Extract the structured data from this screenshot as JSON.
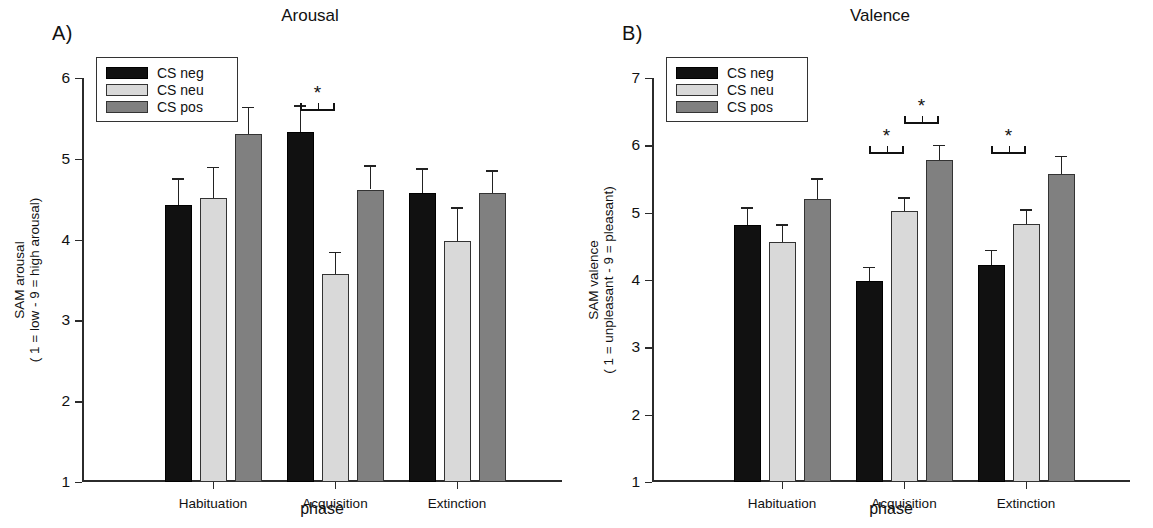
{
  "figure": {
    "panels": [
      {
        "letter": "A)",
        "title": "Arousal",
        "ylabel_line1": "SAM arousal",
        "ylabel_line2": "( 1 = low - 9 = high arousal)",
        "xlabel": "phase"
      },
      {
        "letter": "B)",
        "title": "Valence",
        "ylabel_line1": "SAM valence",
        "ylabel_line2": "( 1 = unpleasant - 9 = pleasant)",
        "xlabel": "phase"
      }
    ],
    "legend": {
      "items": [
        {
          "label": "CS neg",
          "color": "#111111",
          "key": "neg"
        },
        {
          "label": "CS neu",
          "color": "#d9d9d9",
          "key": "neu"
        },
        {
          "label": "CS pos",
          "color": "#808080",
          "key": "pos"
        }
      ]
    },
    "significance_marker": "*"
  },
  "chart_data": [
    {
      "type": "bar",
      "title": "Arousal",
      "panel": "A)",
      "xlabel": "phase",
      "ylabel": "SAM arousal ( 1 = low - 9 = high arousal)",
      "ylim": [
        1,
        6
      ],
      "yticks": [
        1,
        2,
        3,
        4,
        5,
        6
      ],
      "grid": false,
      "legend_position": "top-left",
      "categories": [
        "Habituation",
        "Acquisition",
        "Extinction"
      ],
      "series": [
        {
          "name": "CS neg",
          "color": "#111111",
          "values": [
            4.43,
            5.33,
            4.58
          ],
          "errors": [
            0.33,
            0.33,
            0.3
          ]
        },
        {
          "name": "CS neu",
          "color": "#d9d9d9",
          "values": [
            4.52,
            3.57,
            3.98
          ],
          "errors": [
            0.38,
            0.28,
            0.42
          ]
        },
        {
          "name": "CS pos",
          "color": "#808080",
          "values": [
            5.31,
            4.62,
            4.58
          ],
          "errors": [
            0.33,
            0.3,
            0.28
          ]
        }
      ],
      "annotations": [
        {
          "text": "*",
          "category": "Acquisition",
          "between": [
            "CS neg",
            "CS neu"
          ]
        }
      ]
    },
    {
      "type": "bar",
      "title": "Valence",
      "panel": "B)",
      "xlabel": "phase",
      "ylabel": "SAM valence ( 1 = unpleasant - 9 = pleasant)",
      "ylim": [
        1,
        7
      ],
      "yticks": [
        1,
        2,
        3,
        4,
        5,
        6,
        7
      ],
      "grid": false,
      "legend_position": "top-left",
      "categories": [
        "Habituation",
        "Acquisition",
        "Extinction"
      ],
      "series": [
        {
          "name": "CS neg",
          "color": "#111111",
          "values": [
            4.82,
            3.98,
            4.23
          ],
          "errors": [
            0.26,
            0.22,
            0.22
          ]
        },
        {
          "name": "CS neu",
          "color": "#d9d9d9",
          "values": [
            4.56,
            5.03,
            4.83
          ],
          "errors": [
            0.27,
            0.2,
            0.22
          ]
        },
        {
          "name": "CS pos",
          "color": "#808080",
          "values": [
            5.21,
            5.78,
            5.58
          ],
          "errors": [
            0.3,
            0.23,
            0.26
          ]
        }
      ],
      "annotations": [
        {
          "text": "*",
          "category": "Acquisition",
          "between": [
            "CS neg",
            "CS neu"
          ]
        },
        {
          "text": "*",
          "category": "Acquisition",
          "between": [
            "CS neu",
            "CS pos"
          ]
        },
        {
          "text": "*",
          "category": "Extinction",
          "between": [
            "CS neg",
            "CS neu"
          ]
        }
      ]
    }
  ]
}
